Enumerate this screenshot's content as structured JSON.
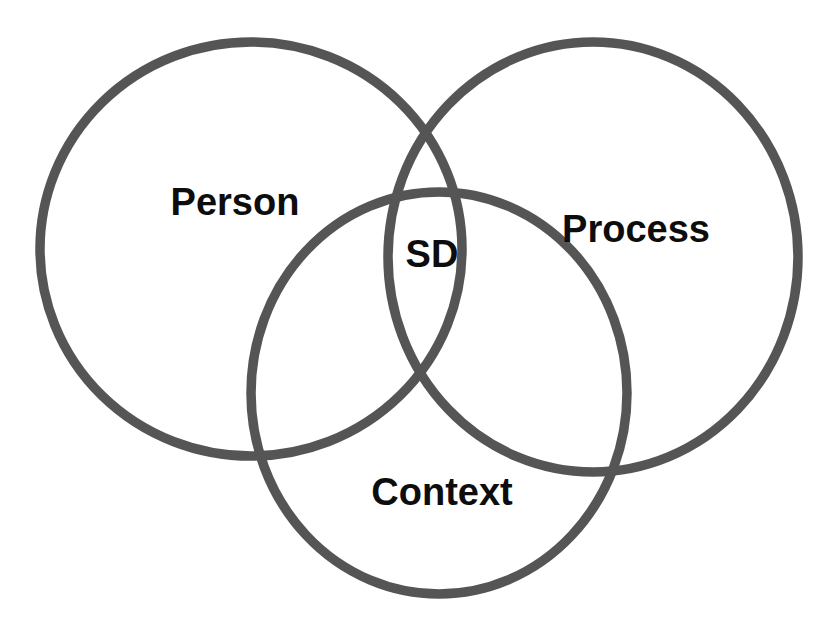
{
  "diagram": {
    "type": "venn",
    "stroke_color": "#555555",
    "background_color": "#ffffff",
    "sets": [
      {
        "id": "person",
        "label": "Person",
        "cx": 251,
        "cy": 249,
        "rx": 211,
        "ry": 207,
        "label_x": 235,
        "label_y": 215
      },
      {
        "id": "process",
        "label": "Process",
        "cx": 593,
        "cy": 257,
        "rx": 205,
        "ry": 215,
        "label_x": 636,
        "label_y": 242
      },
      {
        "id": "context",
        "label": "Context",
        "cx": 439,
        "cy": 393,
        "rx": 188,
        "ry": 201,
        "label_x": 442,
        "label_y": 505
      }
    ],
    "intersection": {
      "label": "SD",
      "x": 432,
      "y": 267
    }
  }
}
